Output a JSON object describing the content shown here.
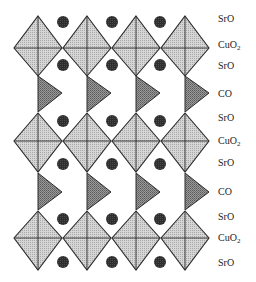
{
  "diagram": {
    "colors": {
      "octahedron_fill": "#cdcdcd",
      "octahedron_edge": "#2a2a2a",
      "triangle_fill": "#8a8a8a",
      "atom_fill": "#333333",
      "background": "#ffffff"
    },
    "octahedron_columns_x": [
      38,
      87,
      136,
      185
    ],
    "octahedron_half_width": 24,
    "octahedron_rows": [
      {
        "top": 16,
        "mid": 48,
        "bottom": 76
      },
      {
        "top": 113,
        "mid": 141,
        "bottom": 172
      },
      {
        "top": 211,
        "mid": 238,
        "bottom": 270
      }
    ],
    "triangle_rows": [
      {
        "top": 76,
        "tip_y": 93,
        "bottom": 112
      },
      {
        "top": 173,
        "tip_y": 192,
        "bottom": 210
      }
    ],
    "atom_columns_x": [
      63,
      112,
      160
    ],
    "atom_rows_y": [
      22,
      65,
      121,
      164,
      219,
      262
    ],
    "atom_radius": 6
  },
  "layers": [
    {
      "label": "SrO",
      "y": 14
    },
    {
      "label": "CuO",
      "sub": "2",
      "y": 40
    },
    {
      "label": "SrO",
      "y": 61
    },
    {
      "label": "CO",
      "y": 89
    },
    {
      "label": "SrO",
      "y": 113
    },
    {
      "label": "CuO",
      "sub": "2",
      "y": 136
    },
    {
      "label": "SrO",
      "y": 158
    },
    {
      "label": "CO",
      "y": 187
    },
    {
      "label": "SrO",
      "y": 212
    },
    {
      "label": "CuO",
      "sub": "2",
      "y": 233
    },
    {
      "label": "SrO",
      "y": 258
    }
  ]
}
